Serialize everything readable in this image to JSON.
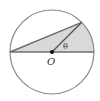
{
  "diagram": {
    "type": "geometry",
    "labels": {
      "center": "O",
      "angle": "θ"
    },
    "colors": {
      "stroke": "#888888",
      "chord": "#6e6e6e",
      "shade": "#d9d9d9",
      "point": "#111111",
      "text": "#333333"
    }
  }
}
